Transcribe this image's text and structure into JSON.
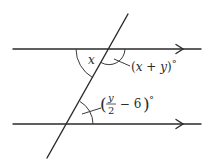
{
  "diagram": {
    "type": "parallel-lines-transversal",
    "stroke_color": "#2b2b2b",
    "parallel_lines": [
      {
        "name": "top-line",
        "y": 49,
        "x1": 13,
        "x2": 201,
        "arrow": "right"
      },
      {
        "name": "bottom-line",
        "y": 124,
        "x1": 13,
        "x2": 201,
        "arrow": "right"
      }
    ],
    "transversal": {
      "x1": 128,
      "y1": 14,
      "x2": 47,
      "y2": 158
    },
    "angles": {
      "top_left": {
        "label": "x"
      },
      "top_right": {
        "open": "(",
        "a": "x",
        "plus": " + ",
        "b": "y",
        "close": ")",
        "degree": "°"
      },
      "bottom_right": {
        "open": "(",
        "num": "y",
        "den": "2",
        "minus": " − 6",
        "close": ")",
        "degree": "°"
      }
    }
  }
}
